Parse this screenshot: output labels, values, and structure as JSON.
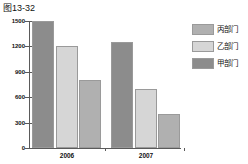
{
  "figure": {
    "caption": "图13-32"
  },
  "chart_data": {
    "type": "bar",
    "title": "",
    "xlabel": "",
    "ylabel": "",
    "categories": [
      "2006",
      "2007"
    ],
    "ylim": [
      0,
      1500
    ],
    "yticks": [
      0,
      300,
      600,
      900,
      1200,
      1500
    ],
    "grid": false,
    "legend_position": "right",
    "series": [
      {
        "name": "甲部门",
        "values": [
          1500,
          1250
        ],
        "color": "#8c8c8c"
      },
      {
        "name": "乙部门",
        "values": [
          1200,
          700
        ],
        "color": "#d6d6d6"
      },
      {
        "name": "丙部门",
        "values": [
          800,
          400
        ],
        "color": "#b0b0b0"
      }
    ],
    "legend_order": [
      "丙部门",
      "乙部门",
      "甲部门"
    ]
  },
  "legend": {
    "items": [
      {
        "label": "丙部门",
        "color": "#b0b0b0"
      },
      {
        "label": "乙部门",
        "color": "#d6d6d6"
      },
      {
        "label": "甲部门",
        "color": "#8c8c8c"
      }
    ]
  }
}
